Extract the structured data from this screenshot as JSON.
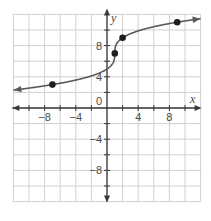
{
  "chart_data": {
    "type": "line",
    "title": "",
    "xlabel": "x",
    "ylabel": "y",
    "xlim": [
      -12,
      12
    ],
    "ylim": [
      -12,
      12
    ],
    "grid": true,
    "grid_step": 2,
    "x_ticks": [
      -8,
      -4,
      0,
      4,
      8
    ],
    "x_tick_labels": [
      "−8",
      "−4",
      "0",
      "4",
      "8"
    ],
    "y_ticks": [
      8,
      4,
      -4,
      -8
    ],
    "y_tick_labels": [
      "8",
      "4",
      "−4",
      "−8"
    ],
    "series": [
      {
        "name": "f(x) = 2∛(x − 1) + 7",
        "function": "2*cbrt(x-1)+7",
        "x_range": [
          -12,
          12
        ],
        "arrows": "both",
        "points": [
          {
            "x": -7,
            "y": 3
          },
          {
            "x": 1,
            "y": 7
          },
          {
            "x": 2,
            "y": 9
          },
          {
            "x": 9,
            "y": 11
          }
        ]
      }
    ],
    "legend": null
  },
  "colors": {
    "grid": "#cfcfcf",
    "axis": "#3a3a3a",
    "curve": "#5a5a5a",
    "point": "#1e1e1e",
    "text": "#4a4a4a"
  },
  "labels": {
    "x_axis": "x",
    "y_axis": "y"
  }
}
